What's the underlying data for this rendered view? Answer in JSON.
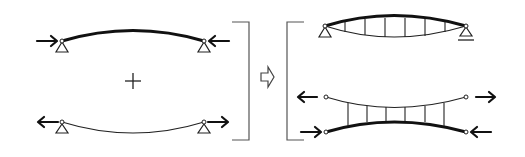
{
  "diagram": {
    "colors": {
      "stroke": "#111111",
      "bracket": "#555555",
      "background": "#ffffff"
    },
    "left_group": {
      "top_member": {
        "type": "arch",
        "line_weight": "thick",
        "end_forces": "compression",
        "supports": [
          "pin",
          "pin"
        ]
      },
      "operator": "+",
      "bottom_member": {
        "type": "cable",
        "line_weight": "thin",
        "end_forces": "tension",
        "supports": [
          "pin",
          "pin"
        ]
      }
    },
    "result_operator": "⇨",
    "right_group": {
      "top_system": {
        "type": "lenticular-truss",
        "verticals": 7,
        "supports": [
          "pin",
          "roller"
        ]
      },
      "bottom_system": {
        "type": "inverted-truss",
        "top_chord": "tension",
        "bottom_chord": "compression",
        "verticals": 6
      }
    },
    "symbols": {
      "plus": "+",
      "implies": "⇨"
    }
  }
}
